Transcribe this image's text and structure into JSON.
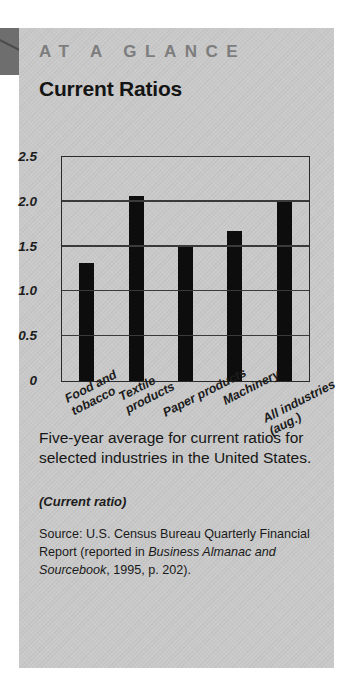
{
  "panel": {
    "kicker": "AT A GLANCE",
    "title": "Current Ratios",
    "caption": "Five-year average for current ratios for selected industries in the United States.",
    "subnote": "(Current ratio)",
    "source": {
      "lead": "Source: U.S. Census Bureau Quarterly Financial Report (reported in ",
      "italic": "Business Almanac and Sourcebook",
      "tail": ", 1995, p. 202)."
    }
  },
  "colors": {
    "panel_bg": "#c9c9c9",
    "tab": "#6e6e6e",
    "bar": "#0d0d0d",
    "kicker": "#7d7d7d",
    "axis": "#2a2a2a"
  },
  "chart_data": {
    "type": "bar",
    "title": "Current Ratios",
    "xlabel": "",
    "ylabel": "",
    "ylim": [
      0,
      2.5
    ],
    "yticks": [
      "2.5",
      "2.0",
      "1.5",
      "1.0",
      "0.5",
      "0"
    ],
    "ytick_values": [
      2.5,
      2.0,
      1.5,
      1.0,
      0.5,
      0
    ],
    "grid": true,
    "legend": "none",
    "categories": [
      "Food and tobacco",
      "Textile products",
      "Paper products",
      "Machinery",
      "All industries (aug.)"
    ],
    "category_lines": [
      [
        "Food and",
        "tobacco"
      ],
      [
        "Textile",
        "products"
      ],
      [
        "Paper products"
      ],
      [
        "Machinery"
      ],
      [
        "All industries",
        "(aug.)"
      ]
    ],
    "values": [
      1.32,
      2.06,
      1.5,
      1.67,
      2.0
    ]
  }
}
